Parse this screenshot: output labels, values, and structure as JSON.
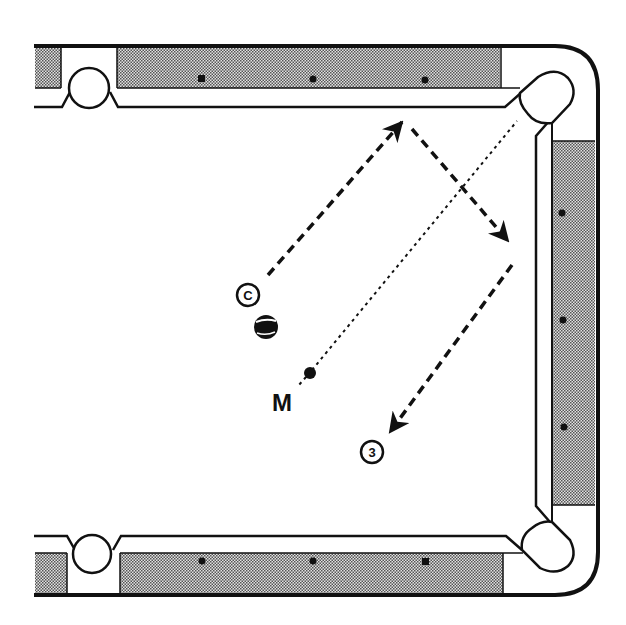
{
  "diagram": {
    "type": "billiards-shot-diagram",
    "colors": {
      "line": "#111111",
      "felt": "#ffffff",
      "rail_stipple_fill": "#cfcfcf",
      "rail_stipple_dot": "#555555",
      "background": "#ffffff"
    },
    "table": {
      "rails": [
        "top",
        "right",
        "bottom"
      ],
      "diamonds": {
        "top": [
          201,
          313,
          425
        ],
        "bottom": [
          201,
          313,
          425
        ],
        "right": [
          213,
          320,
          427
        ]
      },
      "pockets": [
        {
          "id": "top-side-pocket",
          "label": ""
        },
        {
          "id": "top-right-corner-pocket",
          "label": "E"
        },
        {
          "id": "bottom-right-corner-pocket",
          "label": ""
        },
        {
          "id": "bottom-side-pocket",
          "label": ""
        }
      ]
    },
    "balls": {
      "cue": {
        "label": "C"
      },
      "object": {
        "label": "3"
      },
      "striped": {
        "label": ""
      },
      "marker": {
        "label": "M"
      }
    },
    "paths": [
      {
        "id": "cue-path-to-top-rail",
        "style": "dashed",
        "arrow": true
      },
      {
        "id": "cue-path-to-right-rail",
        "style": "dashed",
        "arrow": true
      },
      {
        "id": "cue-path-to-ball-3",
        "style": "dashed",
        "arrow": true
      },
      {
        "id": "aim-line-M-to-E",
        "style": "dotted",
        "arrow": false
      }
    ]
  }
}
